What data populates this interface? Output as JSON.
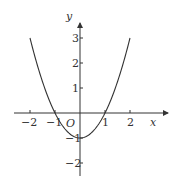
{
  "chart_data": {
    "type": "line",
    "title": "",
    "function": "y = x^2 - 1",
    "xlabel": "x",
    "ylabel": "y",
    "origin_label": "O",
    "xlim": [
      -2.6,
      3.5
    ],
    "ylim": [
      -2.5,
      3.6
    ],
    "x_ticks": [
      -2,
      -1,
      1,
      2
    ],
    "x_tick_labels": [
      "−2",
      "−1",
      "1",
      "2"
    ],
    "y_ticks": [
      3,
      2,
      1,
      -1,
      -2
    ],
    "y_tick_labels": [
      "3",
      "2",
      "1",
      "−1",
      "−2"
    ],
    "grid": false,
    "legend": null,
    "series": [
      {
        "name": "parabola",
        "x": [
          -2,
          -1.5,
          -1,
          -0.5,
          0,
          0.5,
          1,
          1.5,
          2
        ],
        "y": [
          3,
          1.25,
          0,
          -0.75,
          -1,
          -0.75,
          0,
          1.25,
          3
        ]
      }
    ],
    "annotations": {
      "x_intercepts": [
        -1,
        1
      ],
      "vertex": [
        0,
        -1
      ]
    }
  }
}
